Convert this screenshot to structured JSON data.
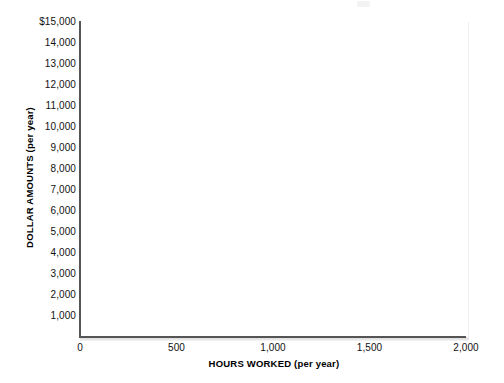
{
  "chart_data": {
    "type": "scatter",
    "title": "",
    "subtitle": "",
    "xlabel": "HOURS WORKED (per year)",
    "ylabel": "DOLLAR AMOUNTS (per year)",
    "xlim": [
      0,
      2000
    ],
    "ylim": [
      0,
      15000
    ],
    "grid": false,
    "legend": null,
    "series": [],
    "annotations": [],
    "note": "Blank plotting template — axes drawn with no data points, lines, or bars.",
    "x_ticks": [
      {
        "value": 0,
        "label": "0"
      },
      {
        "value": 500,
        "label": "500"
      },
      {
        "value": 1000,
        "label": "1,000"
      },
      {
        "value": 1500,
        "label": "1,500"
      },
      {
        "value": 2000,
        "label": "2,000"
      }
    ],
    "y_ticks": [
      {
        "value": 15000,
        "label": "$15,000"
      },
      {
        "value": 14000,
        "label": "14,000"
      },
      {
        "value": 13000,
        "label": "13,000"
      },
      {
        "value": 12000,
        "label": "12,000"
      },
      {
        "value": 11000,
        "label": "11,000"
      },
      {
        "value": 10000,
        "label": "10,000"
      },
      {
        "value": 9000,
        "label": "9,000"
      },
      {
        "value": 8000,
        "label": "8,000"
      },
      {
        "value": 7000,
        "label": "7,000"
      },
      {
        "value": 6000,
        "label": "6,000"
      },
      {
        "value": 5000,
        "label": "5,000"
      },
      {
        "value": 4000,
        "label": "4,000"
      },
      {
        "value": 3000,
        "label": "3,000"
      },
      {
        "value": 2000,
        "label": "2,000"
      },
      {
        "value": 1000,
        "label": "1,000"
      }
    ],
    "colors": {
      "axis": "#555555",
      "text": "#111111",
      "background": "#ffffff",
      "plot_background": "#ffffff"
    }
  }
}
